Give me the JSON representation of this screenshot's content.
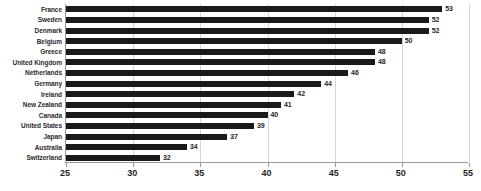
{
  "chart_data": {
    "type": "bar",
    "orientation": "horizontal",
    "title": "",
    "subtitle": "",
    "xlabel": "",
    "ylabel": "",
    "xlim": [
      25,
      55
    ],
    "xticks": [
      25,
      30,
      35,
      40,
      45,
      50,
      55
    ],
    "grid": true,
    "legend": null,
    "sorted": "descending",
    "bar_color": "#1a1a1a",
    "grid_color": "#d6d6d6",
    "axis_color": "#9a9a9a",
    "label_color": "#2b2b2b",
    "value_label_color": "#1f1f1f",
    "show_value_labels": true,
    "categories": [
      "France",
      "Sweden",
      "Denmark",
      "Belgium",
      "Greece",
      "United Kingdom",
      "Netherlands",
      "Germany",
      "Ireland",
      "New Zealand",
      "Canada",
      "United States",
      "Japan",
      "Australia",
      "Switzerland"
    ],
    "values": [
      53,
      52,
      52,
      50,
      48,
      48,
      46,
      44,
      42,
      41,
      40,
      39,
      37,
      34,
      32
    ],
    "value_labels": [
      "53",
      "52",
      "52",
      "50",
      "48",
      "48",
      "46",
      "44",
      "42",
      "41",
      "40",
      "39",
      "37",
      "34",
      "32"
    ],
    "tick_labels": [
      "25",
      "30",
      "35",
      "40",
      "45",
      "50",
      "55"
    ]
  }
}
